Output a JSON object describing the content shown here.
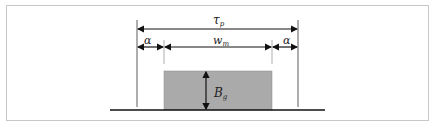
{
  "diagram": {
    "labels": {
      "pole_pitch": "τ",
      "pole_pitch_sub": "p",
      "gap": "α",
      "magnet_width": "w",
      "magnet_width_sub": "m",
      "gap_right": "α",
      "magnet_height": "B",
      "magnet_height_sub": "g"
    },
    "colors": {
      "magnet_fill": "#aaaaaa",
      "line": "#111111",
      "frame": "#c8c8c8"
    }
  }
}
